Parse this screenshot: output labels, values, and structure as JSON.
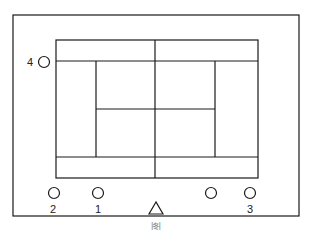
{
  "diagram": {
    "type": "tennis-court-positions",
    "colors": {
      "line": "#1a1a1a",
      "background": "#ffffff"
    },
    "players": [
      {
        "id": "4",
        "label": "4",
        "shape": "circle"
      },
      {
        "id": "2",
        "label": "2",
        "shape": "circle"
      },
      {
        "id": "1",
        "label": "1",
        "shape": "circle"
      },
      {
        "id": "unlabeled",
        "label": "",
        "shape": "circle"
      },
      {
        "id": "3",
        "label": "3",
        "shape": "circle"
      }
    ],
    "marker": {
      "label": "",
      "shape": "triangle"
    },
    "caption": "图"
  }
}
